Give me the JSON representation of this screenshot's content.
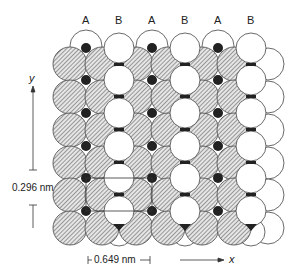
{
  "column_labels": [
    "A",
    "B",
    "A",
    "B",
    "A",
    "B"
  ],
  "axes": {
    "y_label": "y",
    "x_label": "x"
  },
  "dimensions": {
    "vertical": "0.296 nm",
    "horizontal": "0.649 nm"
  },
  "colors": {
    "hatched_fill": "#c8c8c8",
    "outline": "#444444",
    "dark_atom": "#222222",
    "white_atom": "#ffffff"
  }
}
